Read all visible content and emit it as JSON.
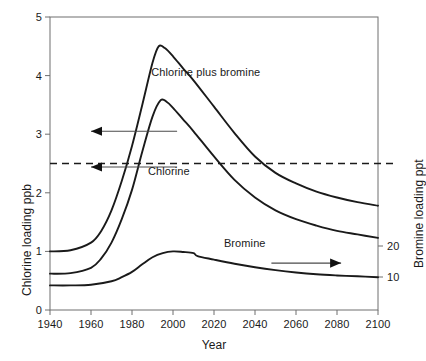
{
  "chart_data": {
    "type": "line",
    "title": "",
    "xlabel": "Year",
    "ylabel": "Chlorine  loading  ppb",
    "y2label": "Bromine loading ppt",
    "xlim": [
      1940,
      2100
    ],
    "ylim": [
      0,
      5
    ],
    "y2lim": [
      0,
      50
    ],
    "xticks": [
      1940,
      1960,
      1980,
      2000,
      2020,
      2040,
      2060,
      2080,
      2100
    ],
    "xtick_labels": [
      "1940",
      "1960",
      "1980",
      "2000",
      "2020",
      "2040",
      "2060",
      "2080",
      "2100"
    ],
    "yticks": [
      0,
      1,
      2,
      3,
      4,
      5
    ],
    "ytick_labels": [
      "0",
      "1",
      "2",
      "3",
      "4",
      "5"
    ],
    "y2ticks": [
      10,
      20
    ],
    "y2tick_labels": [
      "10",
      "20"
    ],
    "grid": false,
    "legend": "inline-annotations",
    "annotations": [
      {
        "text": "Chlorine plus bromine",
        "x": 2016,
        "y": 4.05,
        "axis": "left"
      },
      {
        "text": "Chlorine",
        "x": 1998,
        "y": 2.35,
        "axis": "left"
      },
      {
        "text": "Bromine",
        "x": 2035,
        "y": 1.12,
        "axis": "right"
      }
    ],
    "reference_lines": [
      {
        "orientation": "horizontal",
        "value": 2.5,
        "style": "dashed",
        "axis": "left"
      }
    ],
    "axis_pointers": [
      {
        "direction": "left",
        "target_axis": "left",
        "x_from": 2002,
        "x_to": 1960,
        "y": 3.05
      },
      {
        "direction": "left",
        "target_axis": "left",
        "x_from": 2002,
        "x_to": 1960,
        "y": 2.44
      },
      {
        "direction": "right",
        "target_axis": "right",
        "x_from": 2048,
        "x_to": 2082,
        "y": 0.8
      }
    ],
    "series": [
      {
        "name": "Chlorine plus bromine",
        "axis": "left",
        "x": [
          1940,
          1950,
          1960,
          1965,
          1970,
          1975,
          1980,
          1985,
          1990,
          1993,
          1996,
          2000,
          2005,
          2010,
          2020,
          2030,
          2040,
          2050,
          2060,
          2070,
          2080,
          2090,
          2100
        ],
        "values": [
          1.0,
          1.02,
          1.15,
          1.35,
          1.7,
          2.2,
          2.8,
          3.5,
          4.22,
          4.5,
          4.47,
          4.33,
          4.12,
          3.92,
          3.47,
          3.02,
          2.62,
          2.34,
          2.16,
          2.02,
          1.92,
          1.84,
          1.78
        ]
      },
      {
        "name": "Chlorine",
        "axis": "left",
        "x": [
          1940,
          1950,
          1960,
          1965,
          1970,
          1975,
          1980,
          1985,
          1990,
          1994,
          1997,
          2000,
          2005,
          2010,
          2020,
          2030,
          2040,
          2050,
          2060,
          2070,
          2080,
          2090,
          2100
        ],
        "values": [
          0.62,
          0.63,
          0.72,
          0.88,
          1.15,
          1.55,
          2.05,
          2.7,
          3.3,
          3.58,
          3.55,
          3.45,
          3.25,
          3.05,
          2.62,
          2.22,
          1.92,
          1.7,
          1.55,
          1.44,
          1.35,
          1.29,
          1.23
        ]
      },
      {
        "name": "Bromine",
        "axis": "right",
        "x": [
          1940,
          1950,
          1960,
          1970,
          1975,
          1980,
          1985,
          1990,
          1995,
          2000,
          2005,
          2010,
          2012,
          2020,
          2030,
          2040,
          2050,
          2060,
          2070,
          2080,
          2090,
          2100
        ],
        "values": [
          0.42,
          0.42,
          0.43,
          0.49,
          0.56,
          0.65,
          0.78,
          0.9,
          0.97,
          1.0,
          0.99,
          0.97,
          0.92,
          0.86,
          0.79,
          0.73,
          0.68,
          0.64,
          0.61,
          0.59,
          0.575,
          0.56
        ]
      }
    ]
  },
  "axis_titles": {
    "x": "Year",
    "y_left": "Chlorine  loading  ppb",
    "y_right": "Bromine loading ppt"
  },
  "colors": {
    "line": "#1a1a1a",
    "axis": "#6e6e6e",
    "background": "#ffffff",
    "text": "#1a1a1a"
  }
}
